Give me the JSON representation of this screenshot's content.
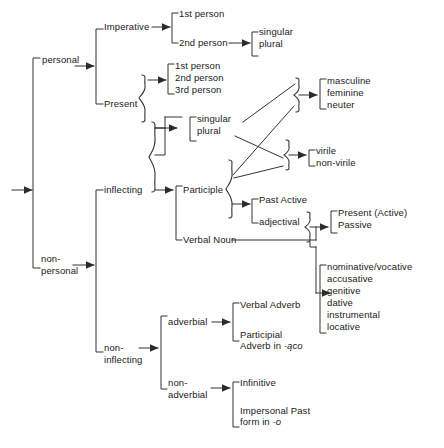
{
  "diagram": {
    "type": "tree-diagram",
    "line_color": "#333333",
    "text_color": "#1a1a1a",
    "background": "#ffffff",
    "root": {
      "label": "",
      "incoming_arrow": true
    },
    "nodes": {
      "personal": "personal",
      "non_personal": "non-\npersonal",
      "imperative": "Imperative",
      "present": "Present",
      "inflecting": "inflecting",
      "non_inflecting": "non-\ninflecting",
      "imp_1st": "1st person",
      "imp_2nd": "2nd person",
      "imp_singular": "singular",
      "imp_plural": "plural",
      "pres_1st": "1st person",
      "pres_2nd": "2nd person",
      "pres_3rd": "3rd person",
      "num_singular": "singular",
      "num_plural": "plural",
      "masculine": "masculine",
      "feminine": "feminine",
      "neuter": "neuter",
      "virile": "virile",
      "non_virile": "non-virile",
      "participle": "Participle",
      "verbal_noun": "Verbal Noun",
      "past_active": "Past Active",
      "adjectival": "adjectival",
      "present_active": "Present (Active)",
      "passive": "Passive",
      "case_nominative_vocative": "nominative/vocative",
      "case_accusative": "accusative",
      "case_genitive": "genitive",
      "case_dative": "dative",
      "case_instrumental": "instrumental",
      "case_locative": "locative",
      "adverbial": "adverbial",
      "non_adverbial": "non-\nadverbial",
      "verbal_adverb": "Verbal Adverb",
      "participial_adverb_line1": "Participial",
      "participial_adverb_line2_prefix": "Adverb in ",
      "participial_adverb_line2_suffix": "-ąco",
      "infinitive": "Infinitive",
      "impersonal_past_line1": "Impersonal Past",
      "impersonal_past_line2_prefix": "form in ",
      "impersonal_past_line2_suffix": "-o"
    },
    "groups": {
      "imperative_persons": [
        "1st person",
        "2nd person"
      ],
      "imperative_number": [
        "singular",
        "plural"
      ],
      "present_persons": [
        "1st person",
        "2nd person",
        "3rd person"
      ],
      "number": [
        "singular",
        "plural"
      ],
      "gender": [
        "masculine",
        "feminine",
        "neuter"
      ],
      "virility": [
        "virile",
        "non-virile"
      ],
      "adjectival_voice": [
        "Present (Active)",
        "Passive"
      ],
      "cases": [
        "nominative/vocative",
        "accusative",
        "genitive",
        "dative",
        "instrumental",
        "locative"
      ],
      "adverbial_forms": [
        "Verbal Adverb",
        "Participial Adverb in -ąco"
      ],
      "non_adverbial_forms": [
        "Infinitive",
        "Impersonal Past form in -o"
      ],
      "participle_branches": [
        "Past Active",
        "adjectival"
      ],
      "inflecting_branches": [
        "Participle",
        "Verbal Noun"
      ],
      "personal_branches": [
        "Imperative",
        "Present"
      ],
      "non_personal_branches": [
        "inflecting",
        "non-inflecting"
      ],
      "root_branches": [
        "personal",
        "non-personal"
      ]
    }
  }
}
